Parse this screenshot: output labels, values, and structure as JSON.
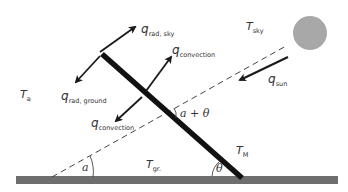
{
  "diagram": {
    "type": "energy-balance schematic",
    "colors": {
      "ground": "#6e6e6e",
      "panel": "#111111",
      "arrow": "#1a1a1a",
      "sun": "#a8a8a8",
      "dashed": "#444444",
      "text": "#333333"
    },
    "labels": {
      "T_a": {
        "main": "T",
        "sub": "a"
      },
      "T_sky": {
        "main": "T",
        "sub": "sky"
      },
      "T_gr": {
        "main": "T",
        "sub": "gr."
      },
      "T_M": {
        "main": "T",
        "sub": "M"
      },
      "q_rad_sky": {
        "main": "q",
        "sub": "rad, sky"
      },
      "q_rad_ground": {
        "main": "q",
        "sub": "rad, ground"
      },
      "q_convection_top": {
        "main": "q",
        "sub": "convection"
      },
      "q_convection_bottom": {
        "main": "q",
        "sub": "convection"
      },
      "q_sun": {
        "main": "q",
        "sub": "sun"
      }
    },
    "angles": {
      "alpha": "a",
      "alpha_plus_theta": "a + θ",
      "theta": "θ"
    },
    "elements": [
      "ground",
      "pv-module",
      "sun",
      "sun-ray-dashed-line",
      "heat-flux-arrows"
    ]
  }
}
